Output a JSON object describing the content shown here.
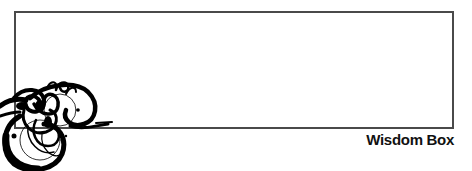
{
  "caption": {
    "text": "Wisdom Box"
  },
  "frame": {
    "border_color": "#4a4a4a",
    "background": "#ffffff"
  },
  "ornament": {
    "icon": "calligraphic-swirl-icon",
    "color": "#000000",
    "position": "bottom-left"
  }
}
